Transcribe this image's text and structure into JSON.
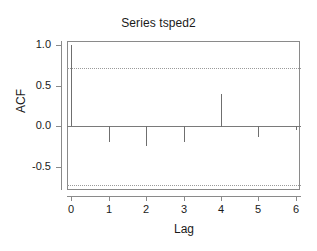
{
  "chart_data": {
    "type": "bar",
    "title": "Series tsped2",
    "xlabel": "Lag",
    "ylabel": "ACF",
    "categories": [
      0,
      1,
      2,
      3,
      4,
      5,
      6
    ],
    "x": [
      0,
      1,
      2,
      3,
      4,
      5,
      6
    ],
    "values": [
      1.0,
      -0.2,
      -0.24,
      -0.2,
      0.4,
      -0.13,
      -0.05
    ],
    "series": [
      {
        "name": "ACF",
        "values": [
          1.0,
          -0.2,
          -0.24,
          -0.2,
          0.4,
          -0.13,
          -0.05
        ]
      }
    ],
    "xlim": [
      -0.12,
      6.12
    ],
    "ylim": [
      -0.78,
      1.05
    ],
    "xticks": [
      0,
      1,
      2,
      3,
      4,
      5,
      6
    ],
    "xticklabels": [
      "0",
      "1",
      "2",
      "3",
      "4",
      "5",
      "6"
    ],
    "yticks": [
      1.0,
      0.5,
      0.0,
      -0.5
    ],
    "yticklabels": [
      "1.0",
      "0.5",
      "0.0",
      "-0.5"
    ],
    "grid": false,
    "legend": null,
    "annotations": [
      {
        "kind": "confidence-band",
        "label": "upper 95% significance bound",
        "value": 0.72,
        "style": "dotted"
      },
      {
        "kind": "confidence-band",
        "label": "lower 95% significance bound",
        "value": -0.72,
        "style": "dotted"
      },
      {
        "kind": "reference-line",
        "label": "zero line",
        "value": 0.0,
        "style": "solid"
      }
    ],
    "colors": {
      "spike": "#6f6f6f",
      "axis": "#8a8a8a",
      "confidence": "#9a9a9a",
      "text": "#1a1a1a",
      "background": "#ffffff"
    }
  }
}
